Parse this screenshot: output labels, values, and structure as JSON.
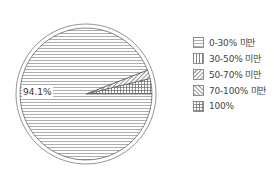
{
  "chart_data": {
    "type": "pie",
    "title": "",
    "categories": [
      "0-30% 미만",
      "30-50% 미만",
      "50-70% 미만",
      "70-100% 미만",
      "100%"
    ],
    "values": [
      94.1,
      0.0,
      2.1,
      0.0,
      3.8
    ],
    "data_labels": [
      {
        "category": "0-30% 미만",
        "text": "94.1%"
      }
    ],
    "patterns": [
      "horizontal-lines",
      "vertical-lines",
      "diagonal-lines",
      "back-diagonal-lines",
      "grid"
    ],
    "legend_position": "right",
    "start_angle_deg": 0,
    "direction": "counterclockwise"
  },
  "legend": [
    {
      "label": "0-30% 미만"
    },
    {
      "label": "30-50% 미만"
    },
    {
      "label": "50-70% 미만"
    },
    {
      "label": "70-100% 미만"
    },
    {
      "label": "100%"
    }
  ],
  "labels": {
    "main_slice": "94.1%"
  }
}
